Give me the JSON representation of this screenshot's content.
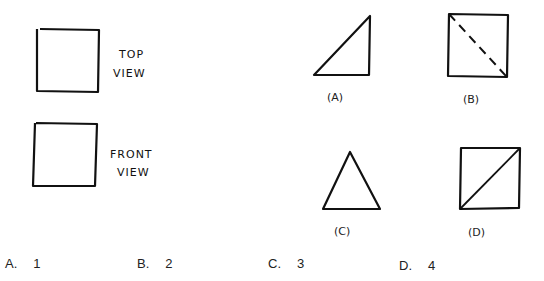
{
  "question_figure": {
    "top_view": {
      "shape": "square",
      "label_line1": "TOP",
      "label_line2": "VIEW"
    },
    "front_view": {
      "shape": "square",
      "label_line1": "FRONT",
      "label_line2": "VIEW"
    }
  },
  "candidate_figures": [
    {
      "id": "A",
      "label": "(A)",
      "shape": "right-triangle"
    },
    {
      "id": "B",
      "label": "(B)",
      "shape": "square-with-dashed-diagonal"
    },
    {
      "id": "C",
      "label": "(C)",
      "shape": "isosceles-triangle"
    },
    {
      "id": "D",
      "label": "(D)",
      "shape": "square-with-solid-diagonal"
    }
  ],
  "options": [
    {
      "letter": "A.",
      "value": "1"
    },
    {
      "letter": "B.",
      "value": "2"
    },
    {
      "letter": "C.",
      "value": "3"
    },
    {
      "letter": "D.",
      "value": "4"
    }
  ]
}
